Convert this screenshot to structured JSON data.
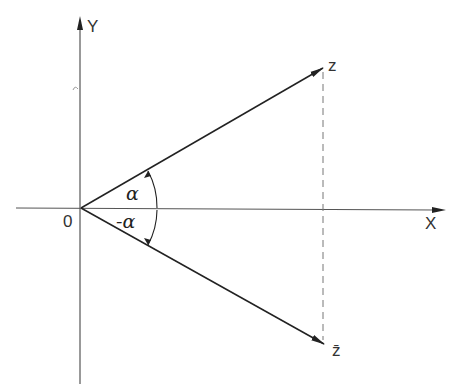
{
  "diagram": {
    "title": "",
    "axes": {
      "x_label": "X",
      "y_label": "Y",
      "origin_label": "0"
    },
    "points": {
      "z_label": "z",
      "z_conj_label": "z̄"
    },
    "angles": {
      "upper_label": "α",
      "lower_label": "-α"
    },
    "colors": {
      "line": "#222222",
      "axis": "#555555",
      "dashed": "#777777"
    }
  }
}
